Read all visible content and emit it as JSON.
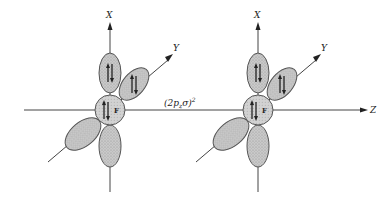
{
  "diagram": {
    "molecules": [
      {
        "atom_label": "F",
        "axes": {
          "x_label": "X",
          "y_label": "Y"
        },
        "orbitals": [
          {
            "name": "2px-upper",
            "electrons": "paired"
          },
          {
            "name": "2py-back",
            "electrons": "paired"
          },
          {
            "name": "core-2s",
            "electrons": "paired"
          },
          {
            "name": "2py-front",
            "electrons": ""
          },
          {
            "name": "2px-lower",
            "electrons": ""
          }
        ]
      },
      {
        "atom_label": "F",
        "axes": {
          "x_label": "X",
          "y_label": "Y"
        },
        "orbitals": [
          {
            "name": "2px-upper",
            "electrons": "paired"
          },
          {
            "name": "2py-back",
            "electrons": "paired"
          },
          {
            "name": "core-2s",
            "electrons": "paired"
          },
          {
            "name": "2py-front",
            "electrons": ""
          },
          {
            "name": "2px-lower",
            "electrons": ""
          }
        ]
      }
    ],
    "bond_label": "(2p",
    "bond_label_sub": "z",
    "bond_label_sigma": "σ)",
    "bond_label_sup": "2",
    "z_axis_label": "Z"
  }
}
